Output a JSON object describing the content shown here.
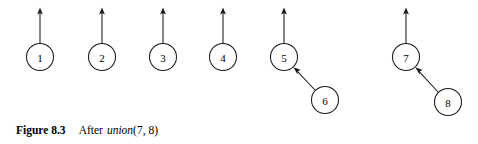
{
  "figure": {
    "caption": {
      "label": "Figure 8.3",
      "text_before_op": "After",
      "operation": "union",
      "arguments": "(7, 8)"
    },
    "canvas": {
      "width": 478,
      "height": 144
    },
    "style": {
      "ink_color": "#1a1a1a",
      "background_color": "#ffffff",
      "node_fill": "#ffffff",
      "node_radius": 13.5
    },
    "nodes": [
      {
        "id": "1",
        "label": "1",
        "cx": 40,
        "cy": 57
      },
      {
        "id": "2",
        "label": "2",
        "cx": 102,
        "cy": 57
      },
      {
        "id": "3",
        "label": "3",
        "cx": 163,
        "cy": 57
      },
      {
        "id": "4",
        "label": "4",
        "cx": 223,
        "cy": 57
      },
      {
        "id": "5",
        "label": "5",
        "cx": 284,
        "cy": 57
      },
      {
        "id": "6",
        "label": "6",
        "cx": 325,
        "cy": 100
      },
      {
        "id": "7",
        "label": "7",
        "cx": 406,
        "cy": 57
      },
      {
        "id": "8",
        "label": "8",
        "cx": 448,
        "cy": 102
      }
    ],
    "root_pointers": [
      {
        "from": "1",
        "x": 40,
        "y_start": 43.5,
        "y_end": 9
      },
      {
        "from": "2",
        "x": 102,
        "y_start": 43.5,
        "y_end": 9
      },
      {
        "from": "3",
        "x": 163,
        "y_start": 43.5,
        "y_end": 9
      },
      {
        "from": "4",
        "x": 223,
        "y_start": 43.5,
        "y_end": 9
      },
      {
        "from": "5",
        "x": 284,
        "y_start": 43.5,
        "y_end": 9
      },
      {
        "from": "7",
        "x": 406,
        "y_start": 43.5,
        "y_end": 9
      }
    ],
    "parent_edges": [
      {
        "from": "6",
        "to": "5",
        "x1": 315.5,
        "y1": 90.5,
        "x2": 293.5,
        "y2": 67.5
      },
      {
        "from": "8",
        "to": "7",
        "x1": 438.5,
        "y1": 92.5,
        "x2": 415.5,
        "y2": 67.5
      }
    ]
  }
}
